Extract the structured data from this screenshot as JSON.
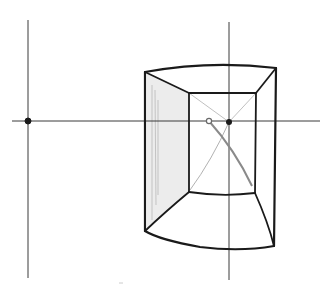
{
  "diagram": {
    "type": "perspective-sketch",
    "colors": {
      "background": "#ffffff",
      "ink": "#1a1a1a",
      "guide": "#3a3a3a",
      "construction": "#9a9a9a",
      "shading": "#cfcfcf"
    },
    "horizon_line": {
      "x1": 12,
      "y1": 121,
      "x2": 320,
      "y2": 121
    },
    "vertical_guides": [
      {
        "x1": 28,
        "y1": 20,
        "x2": 28,
        "y2": 278
      },
      {
        "x1": 229,
        "y1": 22,
        "x2": 229,
        "y2": 280
      }
    ],
    "points": [
      {
        "name": "left-vanishing-point",
        "x": 28,
        "y": 121,
        "style": "filled"
      },
      {
        "name": "center-vanishing-point",
        "x": 229,
        "y": 122,
        "style": "filled"
      },
      {
        "name": "eye-point",
        "x": 209,
        "y": 121,
        "style": "hollow"
      }
    ],
    "outer_frame": {
      "top_left": [
        145,
        72
      ],
      "top_right": [
        276,
        68
      ],
      "bottom_right": [
        274,
        246
      ],
      "bottom_left": [
        145,
        231
      ]
    },
    "inner_frame": {
      "top_left": [
        189,
        93
      ],
      "top_right": [
        256,
        93
      ],
      "bottom_right": [
        255,
        193
      ],
      "bottom_left": [
        189,
        192
      ]
    }
  }
}
